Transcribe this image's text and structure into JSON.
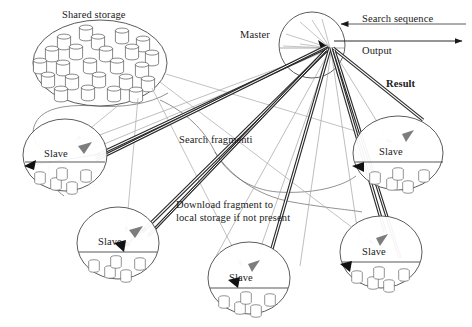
{
  "diagram": {
    "type": "distributed-search-architecture",
    "title_labels": {
      "shared_storage": "Shared storage",
      "master": "Master",
      "search_sequence": "Search sequence",
      "output": "Output",
      "result": "Result",
      "search_fragmenti": "Search fragmenti",
      "download_fragment": "Download fragment to local storage if not present"
    },
    "nodes": {
      "shared_storage": {
        "label": "Shared storage",
        "shape": "ellipse",
        "cx": 100,
        "cy": 63,
        "rx": 68,
        "ry": 43,
        "disk_count": 24
      },
      "master": {
        "label": "Master",
        "shape": "circle",
        "cx": 312,
        "cy": 45,
        "r": 33,
        "hub_x": 330,
        "hub_y": 48
      },
      "slaves": [
        {
          "label": "Slave",
          "cx": 65,
          "cy": 155,
          "rx": 42,
          "ry": 36,
          "disk_count": 5
        },
        {
          "label": "Slave",
          "cx": 118,
          "cy": 243,
          "rx": 40,
          "ry": 36,
          "disk_count": 5
        },
        {
          "label": "Slave",
          "cx": 249,
          "cy": 278,
          "rx": 40,
          "ry": 36,
          "disk_count": 5
        },
        {
          "label": "Slave",
          "cx": 398,
          "cy": 153,
          "rx": 45,
          "ry": 36,
          "disk_count": 5
        },
        {
          "label": "Slave",
          "cx": 381,
          "cy": 252,
          "rx": 40,
          "ry": 36,
          "disk_count": 5
        }
      ]
    },
    "annotations": [
      {
        "name": "shared-storage-label",
        "text": "Shared storage",
        "x": 62,
        "y": 9,
        "bold": false
      },
      {
        "name": "master-label",
        "text": "Master",
        "x": 240,
        "y": 29,
        "bold": false
      },
      {
        "name": "search-sequence-label",
        "text": "Search sequence",
        "x": 365,
        "y": 13,
        "bold": false
      },
      {
        "name": "output-label",
        "text": "Output",
        "x": 364,
        "y": 45,
        "bold": false
      },
      {
        "name": "result-label",
        "text": "Result",
        "x": 387,
        "y": 78,
        "bold": true
      },
      {
        "name": "search-fragmenti-label",
        "text": "Search fragmenti",
        "x": 180,
        "y": 134,
        "bold": false
      },
      {
        "name": "download-fragment-label",
        "text": "Download fragment to local storage if not present",
        "x": 177,
        "y": 199,
        "bold": false
      }
    ],
    "arrow_flows": {
      "search_sequence_direction": "leftward-into-master",
      "output_direction": "rightward-out-of-master",
      "master_to_slave": "search-fragment dispatch",
      "slave_to_master": "result return",
      "shared_storage_to_slave": "download fragment to local storage if not present"
    },
    "colors": {
      "stroke": "#3a3a3a",
      "thin_stroke": "#8a8a8a",
      "text": "#1a1a1a",
      "background": "#ffffff"
    }
  }
}
